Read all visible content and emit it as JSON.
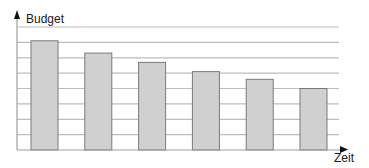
{
  "chart": {
    "y_axis_label": "Budget",
    "x_axis_label": "Zeit"
  },
  "chart_data": {
    "type": "bar",
    "title": "",
    "xlabel": "Zeit",
    "ylabel": "Budget",
    "categories": [
      "",
      "",
      "",
      "",
      "",
      ""
    ],
    "values": [
      7.1,
      6.3,
      5.7,
      5.1,
      4.6,
      4.0
    ],
    "ylim": [
      0,
      8
    ],
    "grid": true,
    "grid_lines": 8,
    "x_tick_labels": [],
    "y_tick_labels": [],
    "legend": null,
    "colors": {
      "bar_fill": "#d0d0d0",
      "bar_stroke": "#7a7a7a",
      "grid": "#bdbdbd",
      "axis": "#a0a0a0",
      "arrow": "#111111",
      "text": "#1a1a1a"
    }
  }
}
